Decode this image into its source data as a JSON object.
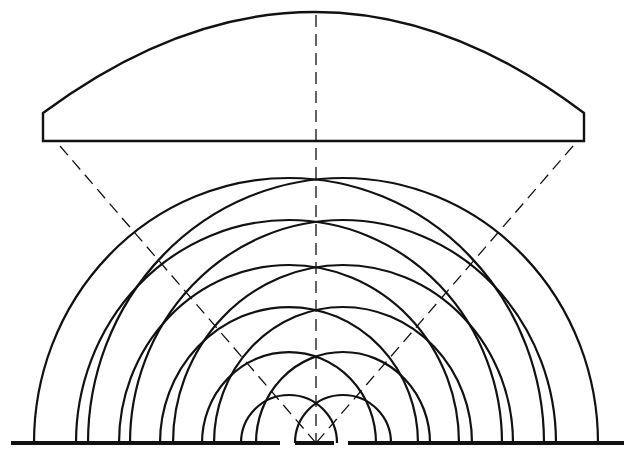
{
  "diagram": {
    "type": "double-slit-interference",
    "colors": {
      "stroke": "#111111",
      "background": "#ffffff"
    },
    "center_x": 316,
    "baseline_y": 443,
    "lens": {
      "left": 43,
      "right": 584,
      "bottom": 141,
      "side_top": 113,
      "apex_y": 12
    },
    "barrier": [
      {
        "x1": 11,
        "x2": 280
      },
      {
        "x1": 295,
        "x2": 334
      },
      {
        "x1": 348,
        "x2": 624
      }
    ],
    "slits": [
      {
        "x": 289
      },
      {
        "x": 343
      }
    ],
    "wavefronts": [
      {
        "rx": 48,
        "ry": 48
      },
      {
        "rx": 87,
        "ry": 91
      },
      {
        "rx": 129,
        "ry": 136
      },
      {
        "rx": 170,
        "ry": 178
      },
      {
        "rx": 213,
        "ry": 223
      },
      {
        "rx": 255,
        "ry": 265
      }
    ],
    "dashed_lines": [
      {
        "x1": 316,
        "y1": 15,
        "x2": 316,
        "y2": 443
      },
      {
        "x1": 60,
        "y1": 146,
        "x2": 316,
        "y2": 443
      },
      {
        "x1": 573,
        "y1": 146,
        "x2": 316,
        "y2": 443
      }
    ]
  }
}
